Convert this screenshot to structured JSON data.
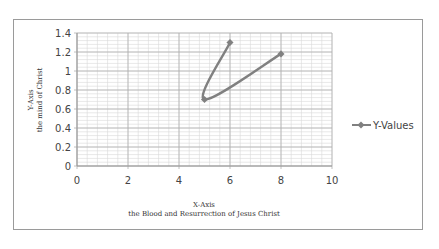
{
  "chart_data": {
    "type": "scatter",
    "mode": "lines+markers",
    "title": "",
    "xlabel": "X-Axis",
    "xlabel_sub": "the Blood and Resurrection of Jesus Christ",
    "ylabel": "Y-Axis",
    "ylabel_sub": "the mind of Christ",
    "xlim": [
      0,
      10
    ],
    "ylim": [
      0,
      1.4
    ],
    "x_ticks": [
      "0",
      "2",
      "4",
      "6",
      "8",
      "10"
    ],
    "y_ticks": [
      "0",
      "0.2",
      "0.4",
      "0.6",
      "0.8",
      "1",
      "1.2",
      "1.4"
    ],
    "grid": true,
    "minor_grid": true,
    "legend_position": "right",
    "series": [
      {
        "name": "Y-Values",
        "color": "#808080",
        "x": [
          6,
          5,
          8
        ],
        "y": [
          1.3,
          0.7,
          1.18
        ]
      }
    ]
  },
  "colors": {
    "line": "#808080",
    "grid_major": "#b0b0b0",
    "grid_minor": "#d8d8d8",
    "frame": "#9a9a9a"
  }
}
